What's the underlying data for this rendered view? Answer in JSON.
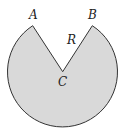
{
  "diagram": {
    "type": "circle-sector",
    "fill_color": "#d9d9d9",
    "stroke_color": "#333333",
    "center": {
      "label": "C",
      "x": 62.7,
      "y": 71.7
    },
    "radius": 55,
    "points": [
      {
        "label": "A",
        "x": 32.7,
        "y": 25.7
      },
      {
        "label": "B",
        "x": 92.3,
        "y": 25.7
      }
    ],
    "labels": {
      "A": "A",
      "B": "B",
      "C": "C",
      "R": "R"
    }
  }
}
